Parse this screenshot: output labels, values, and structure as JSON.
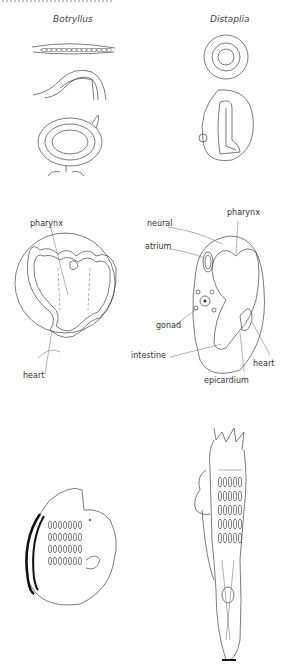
{
  "figure": {
    "columns": [
      {
        "caption": "Botryllus"
      },
      {
        "caption": "Distaplia"
      }
    ],
    "labels": {
      "pharynx_left": "pharynx",
      "pharynx_right": "pharynx",
      "neural": "neural",
      "atrium": "atrium",
      "gonad": "gonad",
      "intestine": "intestine",
      "heart_left": "heart",
      "heart_right": "heart",
      "epicardium": "epicardium"
    }
  }
}
